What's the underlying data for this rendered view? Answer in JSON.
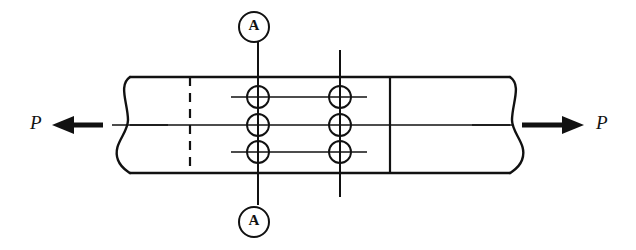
{
  "figure": {
    "type": "engineering-diagram",
    "background_color": "#ffffff",
    "line_color": "#111111",
    "width": 636,
    "height": 250
  },
  "labels": {
    "load_left": "P",
    "load_right": "P",
    "section_top": "A",
    "section_bottom": "A"
  },
  "plate": {
    "left_break_x": 125,
    "right_break_x": 515,
    "top_y": 77,
    "bottom_y": 173,
    "edge_style": "break-line-s-curve"
  },
  "rivets": {
    "radius": 11,
    "columns_x": [
      258,
      340
    ],
    "rows_y": [
      97,
      125,
      152
    ],
    "count": 6
  },
  "section_lines": {
    "primary_x": 258,
    "secondary_x": 340,
    "primary_top_y": 42,
    "primary_bottom_y": 205,
    "secondary_top_y": 50,
    "secondary_bottom_y": 197
  },
  "reference_lines": {
    "dashed_x": 190,
    "solid_x": 390
  },
  "arrows": {
    "left": {
      "tail_x": 165,
      "head_x": 55,
      "y": 125,
      "direction": "left"
    },
    "right": {
      "tail_x": 475,
      "head_x": 585,
      "y": 125,
      "direction": "right"
    }
  }
}
